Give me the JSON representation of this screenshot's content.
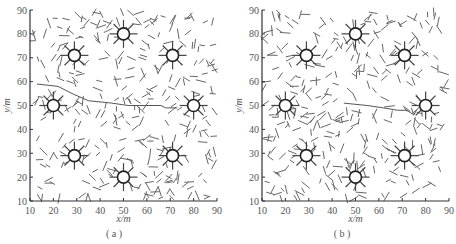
{
  "chart_data": [
    {
      "type": "scatter",
      "panel_label": "( a )",
      "xlabel": "x/m",
      "ylabel": "y/m",
      "xlim": [
        10,
        90
      ],
      "ylim": [
        10,
        90
      ],
      "xticks": [
        10,
        20,
        30,
        40,
        50,
        60,
        70,
        80,
        90
      ],
      "yticks": [
        10,
        20,
        30,
        40,
        50,
        60,
        70,
        80,
        90
      ],
      "grid": false,
      "description": "Random short line segments (fracture/fiber field) with 8 radial star-shaped source wells and a flow path",
      "wells": [
        [
          50,
          80
        ],
        [
          29,
          71
        ],
        [
          71,
          71
        ],
        [
          20,
          50
        ],
        [
          80,
          50
        ],
        [
          29,
          29
        ],
        [
          71,
          29
        ],
        [
          50,
          20
        ]
      ],
      "path": [
        [
          13,
          59
        ],
        [
          22,
          58
        ],
        [
          28,
          55
        ],
        [
          35,
          52
        ],
        [
          45,
          51
        ],
        [
          52,
          50
        ],
        [
          60,
          50
        ],
        [
          66,
          50
        ],
        [
          68,
          49
        ],
        [
          73,
          49
        ]
      ]
    },
    {
      "type": "scatter",
      "panel_label": "( b )",
      "xlabel": "x/m",
      "ylabel": "y/m",
      "xlim": [
        10,
        90
      ],
      "ylim": [
        10,
        90
      ],
      "xticks": [
        10,
        20,
        30,
        40,
        50,
        60,
        70,
        80,
        90
      ],
      "yticks": [
        10,
        20,
        30,
        40,
        50,
        60,
        70,
        80,
        90
      ],
      "grid": false,
      "description": "Random short line segments (fracture/fiber field) with 8 radial star-shaped source wells and a flow path",
      "wells": [
        [
          50,
          80
        ],
        [
          29,
          71
        ],
        [
          71,
          71
        ],
        [
          20,
          50
        ],
        [
          80,
          50
        ],
        [
          29,
          29
        ],
        [
          71,
          29
        ],
        [
          50,
          20
        ]
      ],
      "path": [
        [
          45,
          51
        ],
        [
          55,
          50
        ],
        [
          62,
          49
        ],
        [
          68,
          48
        ],
        [
          72,
          48
        ],
        [
          75,
          46
        ],
        [
          76,
          48
        ],
        [
          78,
          50
        ]
      ]
    }
  ],
  "panels": [
    {
      "caption": "( a )",
      "xlabel": "x/m",
      "ylabel": "y/m"
    },
    {
      "caption": "( b )",
      "xlabel": "x/m",
      "ylabel": "y/m"
    }
  ]
}
